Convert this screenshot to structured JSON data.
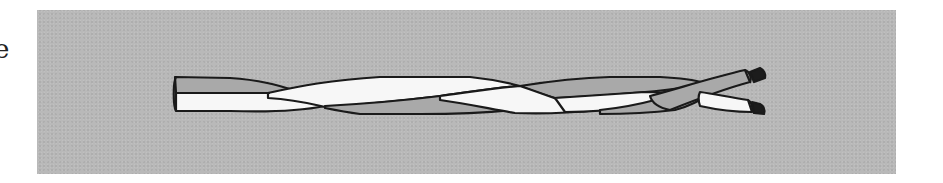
{
  "page": {
    "edge_text": "e"
  },
  "figure": {
    "colors": {
      "panel_background": "#b9b9b9",
      "wire_gray": "#a9a9a9",
      "wire_white": "#f7f7f7",
      "outline": "#1a1a1a",
      "conductor": "#1c1c1c"
    }
  }
}
